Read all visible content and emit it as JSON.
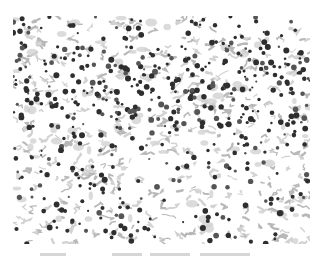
{
  "figure": {
    "colors": {
      "background": "#ffffff",
      "particle_dark": "#2e2e2e",
      "particle_mid": "#555555",
      "fiber_light": "#b8b8b8",
      "fiber_pale": "#d2d2d2"
    },
    "caption_visible": false
  }
}
